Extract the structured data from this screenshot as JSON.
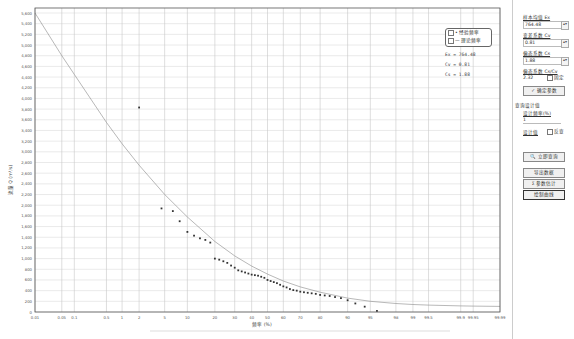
{
  "chart_data": {
    "type": "scatter",
    "title": "",
    "xlabel": "频率 (%)",
    "ylabel": "流量 Q (m³/s)",
    "x_scale": "probability",
    "x_ticks": [
      "0.01",
      "0.05",
      "0.1",
      "0.5",
      "1",
      "2",
      "5",
      "10",
      "20",
      "30",
      "40",
      "50",
      "60",
      "70",
      "80",
      "90",
      "95",
      "98",
      "99",
      "99.5",
      "99.9",
      "99.95",
      "99.99"
    ],
    "y_ticks": [
      0,
      200,
      400,
      600,
      800,
      1000,
      1200,
      1400,
      1600,
      1800,
      2000,
      2200,
      2400,
      2600,
      2800,
      3000,
      3200,
      3400,
      3600,
      3800,
      4000,
      4200,
      4400,
      4600,
      4800,
      5000,
      5200,
      5400,
      5600
    ],
    "ylim": [
      0,
      5600
    ],
    "grid": true,
    "legend_position": "top-right",
    "series": [
      {
        "name": "经验频率",
        "kind": "points",
        "x": [
          2,
          4.5,
          6.5,
          8,
          10,
          12,
          14,
          16,
          18,
          20,
          22,
          24,
          26,
          28,
          30,
          32,
          34,
          36,
          38,
          40,
          42,
          44,
          46,
          48,
          50,
          52,
          54,
          56,
          58,
          60,
          62,
          64,
          66,
          68,
          70,
          72,
          74,
          76,
          78,
          80,
          82,
          84,
          86,
          88,
          90,
          92,
          94,
          96
        ],
        "y": [
          3830,
          1940,
          1890,
          1700,
          1500,
          1430,
          1380,
          1350,
          1300,
          1000,
          980,
          950,
          920,
          870,
          830,
          780,
          760,
          740,
          720,
          700,
          690,
          680,
          660,
          640,
          600,
          580,
          560,
          540,
          510,
          480,
          460,
          430,
          410,
          400,
          380,
          370,
          360,
          350,
          340,
          320,
          310,
          300,
          280,
          260,
          220,
          160,
          100,
          20
        ]
      },
      {
        "name": "理论频率",
        "kind": "line",
        "x": [
          0.01,
          0.05,
          0.1,
          0.5,
          1,
          2,
          5,
          10,
          20,
          30,
          40,
          50,
          60,
          70,
          80,
          90,
          95,
          98,
          99,
          99.5,
          99.9,
          99.95,
          99.99
        ],
        "y": [
          5600,
          4800,
          4450,
          3550,
          3150,
          2750,
          2200,
          1780,
          1320,
          1050,
          860,
          710,
          580,
          470,
          370,
          260,
          200,
          160,
          140,
          130,
          115,
          110,
          105
        ]
      }
    ],
    "annotations": [
      "Ex = 764.48",
      "Cv = 0.81",
      "Cs = 1.88"
    ]
  },
  "legend": {
    "items": [
      {
        "label": "• 经验频率",
        "checked": true
      },
      {
        "label": "— 理论频率",
        "checked": true
      }
    ]
  },
  "params_display": {
    "ex": "Ex = 764.48",
    "cv": "Cv = 0.81",
    "cs": "Cs = 1.88"
  },
  "panel": {
    "ex_label": "样本均值 Ex",
    "ex_value": "764.48",
    "cv_label": "变差系数 Cv",
    "cv_value": "0.81",
    "cs_label": "偏态系数 Cs",
    "cs_value": "1.88",
    "ratio_label": "偏态系数 Cs/Cv",
    "ratio_value": "2.32",
    "fix_label": "固定",
    "confirm_button": "✓ 确定参数",
    "query_section": "查询设计值",
    "freq_label": "设计频率(%)",
    "freq_value": "1",
    "design_label": "设计值",
    "reverse_label": "反查",
    "query_button": "🔍 立即查询",
    "export_button": "导出数据",
    "estimate_button": "Σ 参数估计",
    "draw_button": "绘制曲线"
  }
}
